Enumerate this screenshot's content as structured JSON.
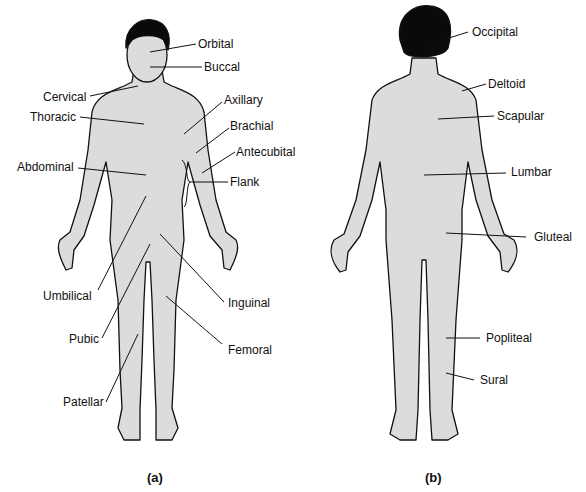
{
  "figure": {
    "panels": [
      {
        "id": "a",
        "caption": "(a)",
        "view": "anterior",
        "labels": [
          "Orbital",
          "Buccal",
          "Cervical",
          "Thoracic",
          "Axillary",
          "Brachial",
          "Antecubital",
          "Abdominal",
          "Flank",
          "Umbilical",
          "Inguinal",
          "Pubic",
          "Femoral",
          "Patellar"
        ]
      },
      {
        "id": "b",
        "caption": "(b)",
        "view": "posterior",
        "labels": [
          "Occipital",
          "Deltoid",
          "Scapular",
          "Lumbar",
          "Gluteal",
          "Popliteal",
          "Sural"
        ]
      }
    ]
  },
  "colors": {
    "body_fill": "#dcdcdc",
    "outline": "#111111",
    "hair": "#0a0a0a",
    "background": "#ffffff"
  }
}
